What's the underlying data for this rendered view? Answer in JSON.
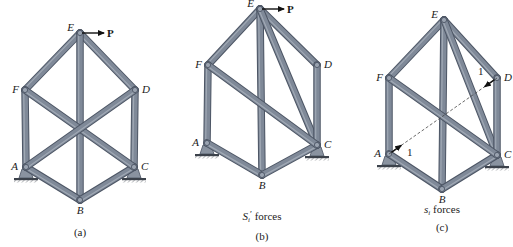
{
  "figure": {
    "colors": {
      "member_fill": "#7f8998",
      "member_edge": "#4d5665",
      "joint_fill": "#9aa3b0",
      "support_fill": "#8a93a0",
      "ground": "#3c424b",
      "text": "#1a1a1a",
      "dashed_line": "#444444",
      "arrow": "#111111"
    },
    "panels": [
      {
        "id": "a",
        "caption": "(a)",
        "subtitle": "",
        "load_label": "P",
        "joints": {
          "A": {
            "label": "A",
            "x": 26,
            "y": 167
          },
          "B": {
            "label": "B",
            "x": 80,
            "y": 200
          },
          "C": {
            "label": "C",
            "x": 134,
            "y": 167
          },
          "D": {
            "label": "D",
            "x": 135,
            "y": 90
          },
          "E": {
            "label": "E",
            "x": 80,
            "y": 33
          },
          "F": {
            "label": "F",
            "x": 25,
            "y": 90
          }
        },
        "members": [
          [
            "E",
            "F"
          ],
          [
            "E",
            "D"
          ],
          [
            "E",
            "B"
          ],
          [
            "F",
            "A"
          ],
          [
            "D",
            "C"
          ],
          [
            "A",
            "B"
          ],
          [
            "B",
            "C"
          ],
          [
            "F",
            "C"
          ],
          [
            "A",
            "D"
          ]
        ]
      },
      {
        "id": "b",
        "caption": "(b)",
        "subtitle_main": "S",
        "subtitle_sub": "i",
        "subtitle_prime": "′",
        "subtitle_rest": " forces",
        "load_label": "P",
        "joints": {
          "A": {
            "label": "A",
            "x": 207,
            "y": 143
          },
          "B": {
            "label": "B",
            "x": 262,
            "y": 175
          },
          "C": {
            "label": "C",
            "x": 317,
            "y": 145
          },
          "D": {
            "label": "D",
            "x": 317,
            "y": 65
          },
          "E": {
            "label": "E",
            "x": 260,
            "y": 9
          },
          "F": {
            "label": "F",
            "x": 208,
            "y": 65
          }
        },
        "members": [
          [
            "E",
            "F"
          ],
          [
            "E",
            "D"
          ],
          [
            "E",
            "B"
          ],
          [
            "E",
            "C"
          ],
          [
            "F",
            "A"
          ],
          [
            "D",
            "C"
          ],
          [
            "A",
            "B"
          ],
          [
            "B",
            "C"
          ],
          [
            "F",
            "C"
          ]
        ]
      },
      {
        "id": "c",
        "caption": "(c)",
        "subtitle_main": "s",
        "subtitle_sub": "i",
        "subtitle_rest": " forces",
        "unit_load_label": "1",
        "joints": {
          "A": {
            "label": "A",
            "x": 389,
            "y": 154
          },
          "B": {
            "label": "B",
            "x": 442,
            "y": 189
          },
          "C": {
            "label": "C",
            "x": 497,
            "y": 155
          },
          "D": {
            "label": "D",
            "x": 497,
            "y": 78
          },
          "E": {
            "label": "E",
            "x": 444,
            "y": 20
          },
          "F": {
            "label": "F",
            "x": 389,
            "y": 78
          }
        },
        "members": [
          [
            "E",
            "F"
          ],
          [
            "E",
            "D"
          ],
          [
            "E",
            "B"
          ],
          [
            "E",
            "C"
          ],
          [
            "F",
            "A"
          ],
          [
            "D",
            "C"
          ],
          [
            "A",
            "B"
          ],
          [
            "B",
            "C"
          ],
          [
            "F",
            "C"
          ]
        ],
        "dashed": [
          "A",
          "D"
        ]
      }
    ]
  }
}
